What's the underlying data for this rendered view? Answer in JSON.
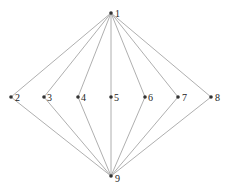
{
  "diagram": {
    "type": "hasse-diagram",
    "colors": {
      "edge": "#9a9a9a",
      "node": "#333333",
      "label": "#222222"
    },
    "nodes": [
      {
        "id": "1",
        "label": "1",
        "x": 111,
        "y": 13,
        "lx": 115,
        "ly": 17
      },
      {
        "id": "2",
        "label": "2",
        "x": 11,
        "y": 97,
        "lx": 15,
        "ly": 101
      },
      {
        "id": "3",
        "label": "3",
        "x": 44,
        "y": 97,
        "lx": 47,
        "ly": 101
      },
      {
        "id": "4",
        "label": "4",
        "x": 78,
        "y": 97,
        "lx": 81,
        "ly": 101
      },
      {
        "id": "5",
        "label": "5",
        "x": 111,
        "y": 97,
        "lx": 114,
        "ly": 101
      },
      {
        "id": "6",
        "label": "6",
        "x": 145,
        "y": 97,
        "lx": 148,
        "ly": 101
      },
      {
        "id": "7",
        "label": "7",
        "x": 178,
        "y": 97,
        "lx": 182,
        "ly": 101
      },
      {
        "id": "8",
        "label": "8",
        "x": 211,
        "y": 97,
        "lx": 215,
        "ly": 101
      },
      {
        "id": "9",
        "label": "9",
        "x": 111,
        "y": 176,
        "lx": 115,
        "ly": 182
      }
    ],
    "edges": [
      [
        "1",
        "2"
      ],
      [
        "1",
        "3"
      ],
      [
        "1",
        "4"
      ],
      [
        "1",
        "5"
      ],
      [
        "1",
        "6"
      ],
      [
        "1",
        "7"
      ],
      [
        "1",
        "8"
      ],
      [
        "2",
        "9"
      ],
      [
        "3",
        "9"
      ],
      [
        "4",
        "9"
      ],
      [
        "5",
        "9"
      ],
      [
        "6",
        "9"
      ],
      [
        "7",
        "9"
      ],
      [
        "8",
        "9"
      ]
    ]
  }
}
